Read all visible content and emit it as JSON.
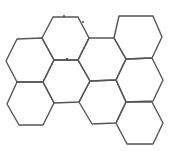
{
  "diagram": {
    "type": "hexagonal-grid",
    "stroke_color": "#555555",
    "background": "#ffffff",
    "hexagons": [
      {
        "id": "hex-top-center",
        "points": "53,17 78,17 89,38 78,60 54,60 42,38"
      },
      {
        "id": "hex-top-right",
        "points": "119,16 153,16 162,37 152,58 126,59 114,38"
      },
      {
        "id": "hex-left-upper",
        "points": "17,39 42,38 54,60 43,82 17,82 6,61"
      },
      {
        "id": "hex-center-upper",
        "points": "89,38 114,38 126,59 116,80 90,81 78,60"
      },
      {
        "id": "hex-middle",
        "points": "54,60 78,60 90,81 79,102 54,103 43,82"
      },
      {
        "id": "hex-right-middle",
        "points": "126,59 152,58 163,80 153,101 126,102 116,80"
      },
      {
        "id": "hex-left-lower",
        "points": "17,82 43,82 54,103 43,125 19,125 7,104"
      },
      {
        "id": "hex-center-lower",
        "points": "90,81 116,80 126,102 116,123 92,124 79,102"
      },
      {
        "id": "hex-bottom-right",
        "points": "126,102 152,102 163,123 153,144 127,144 116,123"
      }
    ],
    "dots": [
      {
        "cx": 64,
        "cy": 16
      },
      {
        "cx": 83,
        "cy": 22
      },
      {
        "cx": 67,
        "cy": 59
      }
    ]
  }
}
